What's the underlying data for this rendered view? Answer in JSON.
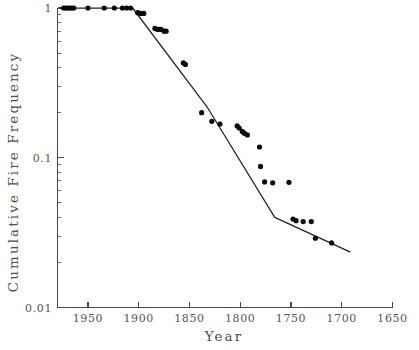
{
  "chart_data": {
    "type": "scatter",
    "title": "",
    "xlabel": "Year",
    "ylabel": "Cumulative Fire Frequency",
    "xlim": [
      1980,
      1650
    ],
    "ylim": [
      0.01,
      1
    ],
    "yscale": "log",
    "xscale": "linear",
    "x_reversed": true,
    "grid": false,
    "legend": null,
    "xticks": [
      1950,
      1900,
      1850,
      1800,
      1750,
      1700,
      1650
    ],
    "xticklabels": [
      "1950",
      "1900",
      "1850",
      "1800",
      "1750",
      "1700",
      "1650"
    ],
    "yticks": [
      1,
      0.1,
      0.01
    ],
    "yticklabels": [
      "1",
      "0.1",
      "0.01"
    ],
    "y_minor_decades": [
      1,
      0.1
    ],
    "marker": "filled-circle",
    "marker_color": "#0b0b0b",
    "line_color": "#222222",
    "axis_color": "#4a4a4a",
    "label_color": "#555555",
    "background": "#ffffff",
    "points": [
      {
        "x": 1974,
        "y": 1.0
      },
      {
        "x": 1972,
        "y": 1.0
      },
      {
        "x": 1970,
        "y": 1.0
      },
      {
        "x": 1968,
        "y": 1.0
      },
      {
        "x": 1966,
        "y": 1.0
      },
      {
        "x": 1964,
        "y": 1.0
      },
      {
        "x": 1950,
        "y": 1.0
      },
      {
        "x": 1934,
        "y": 1.0
      },
      {
        "x": 1924,
        "y": 1.0
      },
      {
        "x": 1916,
        "y": 1.0
      },
      {
        "x": 1912,
        "y": 1.0
      },
      {
        "x": 1908,
        "y": 1.0
      },
      {
        "x": 1901,
        "y": 0.93
      },
      {
        "x": 1898,
        "y": 0.92
      },
      {
        "x": 1895,
        "y": 0.92
      },
      {
        "x": 1884,
        "y": 0.73
      },
      {
        "x": 1882,
        "y": 0.72
      },
      {
        "x": 1880,
        "y": 0.72
      },
      {
        "x": 1878,
        "y": 0.72
      },
      {
        "x": 1875,
        "y": 0.7
      },
      {
        "x": 1873,
        "y": 0.7
      },
      {
        "x": 1856,
        "y": 0.43
      },
      {
        "x": 1854,
        "y": 0.42
      },
      {
        "x": 1838,
        "y": 0.2
      },
      {
        "x": 1828,
        "y": 0.175
      },
      {
        "x": 1820,
        "y": 0.168
      },
      {
        "x": 1803,
        "y": 0.163
      },
      {
        "x": 1801,
        "y": 0.158
      },
      {
        "x": 1798,
        "y": 0.15
      },
      {
        "x": 1796,
        "y": 0.146
      },
      {
        "x": 1793,
        "y": 0.142
      },
      {
        "x": 1781,
        "y": 0.118
      },
      {
        "x": 1780,
        "y": 0.0875
      },
      {
        "x": 1776,
        "y": 0.069
      },
      {
        "x": 1768,
        "y": 0.068
      },
      {
        "x": 1752,
        "y": 0.0685
      },
      {
        "x": 1748,
        "y": 0.039
      },
      {
        "x": 1745,
        "y": 0.038
      },
      {
        "x": 1738,
        "y": 0.0375
      },
      {
        "x": 1730,
        "y": 0.0375
      },
      {
        "x": 1726,
        "y": 0.029
      },
      {
        "x": 1710,
        "y": 0.027
      }
    ],
    "fit_line": [
      {
        "x": 1978,
        "y": 1.0
      },
      {
        "x": 1906,
        "y": 1.0
      },
      {
        "x": 1832,
        "y": 0.215
      },
      {
        "x": 1766,
        "y": 0.04
      },
      {
        "x": 1692,
        "y": 0.0235
      }
    ]
  }
}
